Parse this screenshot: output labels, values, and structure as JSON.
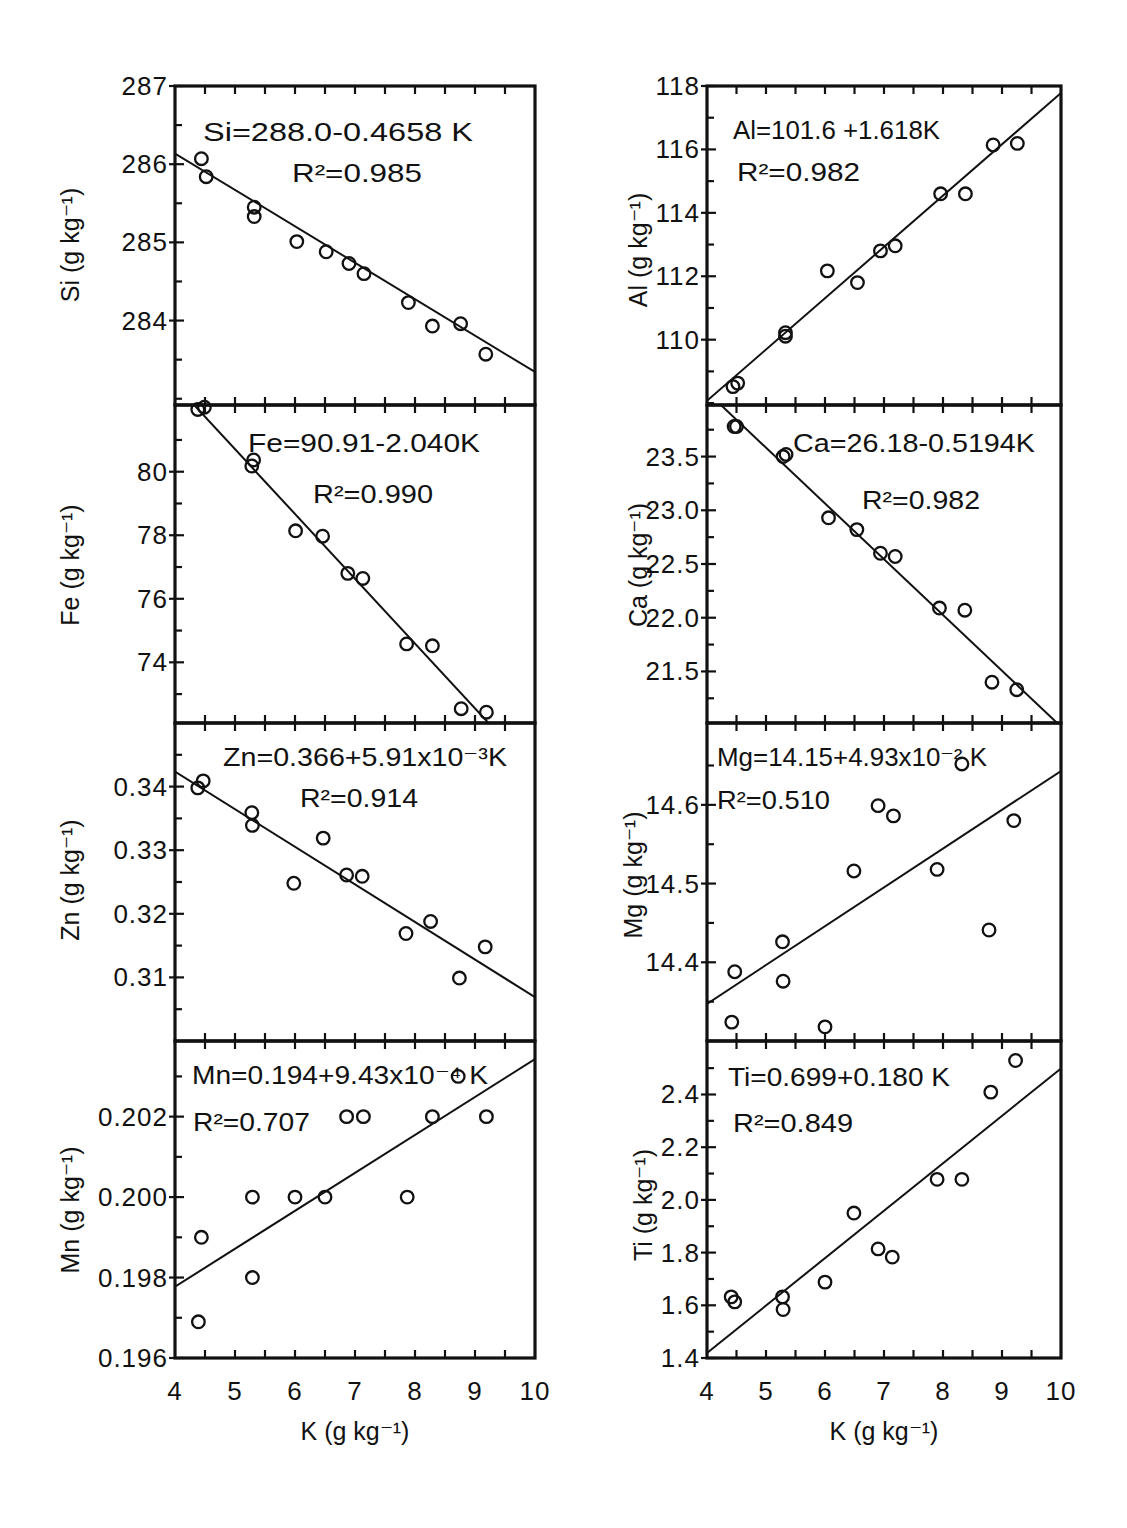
{
  "figure": {
    "panel_order": [
      "Si",
      "Al",
      "Fe",
      "Ca",
      "Zn",
      "Mg",
      "Mn",
      "Ti"
    ]
  },
  "chart_data": [
    {
      "id": "si",
      "type": "scatter",
      "title": "",
      "ylabel": "Si (g kg⁻¹)",
      "xlim": [
        4,
        10
      ],
      "ylim": [
        282.92,
        287.0
      ],
      "yticks": [
        287,
        286,
        285,
        284
      ],
      "yticklabels": [
        "287",
        "286",
        "285",
        "284"
      ],
      "yminor": [
        286.5,
        285.5,
        284.5,
        283.5,
        283.0
      ],
      "equation": "Si=288.0-0.4658 K",
      "r2": "R²=0.985",
      "fit": {
        "intercept": 288.0,
        "slope": -0.4658
      },
      "points": [
        [
          4.44,
          286.07
        ],
        [
          4.52,
          285.84
        ],
        [
          5.32,
          285.45
        ],
        [
          5.32,
          285.33
        ],
        [
          6.03,
          285.01
        ],
        [
          6.52,
          284.88
        ],
        [
          6.9,
          284.73
        ],
        [
          7.15,
          284.6
        ],
        [
          7.89,
          284.23
        ],
        [
          8.29,
          283.93
        ],
        [
          8.76,
          283.96
        ],
        [
          9.18,
          283.57
        ]
      ],
      "grid": false
    },
    {
      "id": "al",
      "type": "scatter",
      "title": "",
      "ylabel": "Al (g kg⁻¹)",
      "xlim": [
        4,
        10
      ],
      "ylim": [
        107.94,
        118.0
      ],
      "yticks": [
        118,
        116,
        114,
        112,
        110
      ],
      "yticklabels": [
        "118",
        "116",
        "114",
        "112",
        "110"
      ],
      "yminor": [
        117,
        115,
        113,
        111,
        109,
        108
      ],
      "equation": "Al=101.6 +1.618K",
      "r2": "R²=0.982",
      "fit": {
        "intercept": 101.6,
        "slope": 1.618
      },
      "points": [
        [
          4.44,
          108.52
        ],
        [
          4.52,
          108.63
        ],
        [
          5.33,
          110.22
        ],
        [
          5.33,
          110.11
        ],
        [
          6.04,
          112.17
        ],
        [
          6.55,
          111.8
        ],
        [
          6.94,
          112.8
        ],
        [
          7.19,
          112.96
        ],
        [
          7.96,
          114.6
        ],
        [
          8.38,
          114.6
        ],
        [
          8.85,
          116.14
        ],
        [
          9.26,
          116.19
        ]
      ],
      "grid": false
    },
    {
      "id": "fe",
      "type": "scatter",
      "title": "",
      "ylabel": "Fe (g kg⁻¹)",
      "xlim": [
        4,
        10
      ],
      "ylim": [
        72.09,
        82.1
      ],
      "yticks": [
        80,
        78,
        76,
        74
      ],
      "yticklabels": [
        "80",
        "78",
        "76",
        "74"
      ],
      "yminor": [
        81,
        79,
        77,
        75,
        73
      ],
      "equation": "Fe=90.91-2.040K",
      "r2": "R²=0.990",
      "fit": {
        "intercept": 90.91,
        "slope": -2.04
      },
      "points": [
        [
          4.38,
          81.96
        ],
        [
          4.49,
          82.03
        ],
        [
          5.31,
          80.37
        ],
        [
          5.28,
          80.18
        ],
        [
          6.01,
          78.14
        ],
        [
          6.46,
          77.97
        ],
        [
          6.88,
          76.8
        ],
        [
          7.13,
          76.64
        ],
        [
          7.86,
          74.58
        ],
        [
          8.29,
          74.52
        ],
        [
          8.77,
          72.54
        ],
        [
          9.19,
          72.43
        ]
      ],
      "grid": false
    },
    {
      "id": "ca",
      "type": "scatter",
      "title": "",
      "ylabel": "Ca (g kg⁻¹)",
      "xlim": [
        4,
        10
      ],
      "ylim": [
        21.02,
        23.98
      ],
      "yticks": [
        23.5,
        23.0,
        22.5,
        22.0,
        21.5
      ],
      "yticklabels": [
        "23.5",
        "23.0",
        "22.5",
        "22.0",
        "21.5"
      ],
      "yminor": [
        23.75,
        23.25,
        22.75,
        22.25,
        21.75,
        21.25
      ],
      "equation": "Ca=26.18-0.5194K",
      "r2": "R²=0.982",
      "fit": {
        "intercept": 26.18,
        "slope": -0.5194
      },
      "points": [
        [
          4.46,
          23.78
        ],
        [
          4.5,
          23.78
        ],
        [
          5.29,
          23.5
        ],
        [
          5.34,
          23.52
        ],
        [
          6.06,
          22.93
        ],
        [
          6.54,
          22.82
        ],
        [
          6.94,
          22.6
        ],
        [
          7.19,
          22.57
        ],
        [
          7.94,
          22.09
        ],
        [
          8.37,
          22.07
        ],
        [
          8.83,
          21.4
        ],
        [
          9.25,
          21.33
        ]
      ],
      "grid": false
    },
    {
      "id": "zn",
      "type": "scatter",
      "title": "",
      "ylabel": "Zn (g kg⁻¹)",
      "xlim": [
        4,
        10
      ],
      "ylim": [
        0.3,
        0.35
      ],
      "yticks": [
        0.34,
        0.33,
        0.32,
        0.31
      ],
      "yticklabels": [
        "0.34",
        "0.33",
        "0.32",
        "0.31"
      ],
      "yminor": [
        0.345,
        0.335,
        0.325,
        0.315,
        0.305
      ],
      "equation": "Zn=0.366+5.91x10⁻³K",
      "r2": "R²=0.914",
      "fit": {
        "intercept": 0.366,
        "slope": -0.00591
      },
      "points": [
        [
          4.38,
          0.3398
        ],
        [
          4.47,
          0.3409
        ],
        [
          5.28,
          0.3359
        ],
        [
          5.29,
          0.3339
        ],
        [
          5.98,
          0.3248
        ],
        [
          6.47,
          0.3319
        ],
        [
          6.86,
          0.3261
        ],
        [
          7.12,
          0.3259
        ],
        [
          7.85,
          0.3169
        ],
        [
          8.26,
          0.3188
        ],
        [
          8.74,
          0.3099
        ],
        [
          9.17,
          0.3148
        ]
      ],
      "grid": false
    },
    {
      "id": "mg",
      "type": "scatter",
      "title": "",
      "ylabel": "Mg (g kg⁻¹)",
      "xlim": [
        4,
        10
      ],
      "ylim": [
        14.3,
        14.704
      ],
      "yticks": [
        14.6,
        14.5,
        14.4
      ],
      "yticklabels": [
        "14.6",
        "14.5",
        "14.4"
      ],
      "yminor": [
        14.65,
        14.55,
        14.45,
        14.35
      ],
      "equation": "Mg=14.15+4.93x10⁻² K",
      "r2": "R²=0.510",
      "fit": {
        "intercept": 14.15,
        "slope": 0.0493
      },
      "points": [
        [
          4.42,
          14.324
        ],
        [
          4.47,
          14.388
        ],
        [
          5.28,
          14.426
        ],
        [
          5.29,
          14.376
        ],
        [
          6.0,
          14.318
        ],
        [
          6.49,
          14.516
        ],
        [
          6.9,
          14.599
        ],
        [
          7.16,
          14.586
        ],
        [
          7.9,
          14.518
        ],
        [
          8.32,
          14.652
        ],
        [
          8.78,
          14.441
        ],
        [
          9.2,
          14.58
        ]
      ],
      "grid": false
    },
    {
      "id": "mn",
      "type": "scatter",
      "title": "",
      "ylabel": "Mn (g kg⁻¹)",
      "xlabel": "K (g kg⁻¹)",
      "xlim": [
        4,
        10
      ],
      "ylim": [
        0.196,
        0.20388
      ],
      "xticks": [
        4,
        5,
        6,
        7,
        8,
        9,
        10
      ],
      "xticklabels": [
        "4",
        "5",
        "6",
        "7",
        "8",
        "9",
        "10"
      ],
      "yticks": [
        0.202,
        0.2,
        0.198,
        0.196
      ],
      "yticklabels": [
        "0.202",
        "0.200",
        "0.198",
        "0.196"
      ],
      "yminor": [
        0.203,
        0.201,
        0.199,
        0.197
      ],
      "equation": "Mn=0.194+9.43x10⁻⁴ K",
      "r2": "R²=0.707",
      "fit": {
        "intercept": 0.194,
        "slope": 0.000943
      },
      "points": [
        [
          4.39,
          0.1969
        ],
        [
          4.44,
          0.199
        ],
        [
          5.29,
          0.2
        ],
        [
          5.29,
          0.198
        ],
        [
          6.0,
          0.2
        ],
        [
          6.5,
          0.2
        ],
        [
          6.86,
          0.202
        ],
        [
          7.14,
          0.202
        ],
        [
          7.87,
          0.2
        ],
        [
          8.29,
          0.202
        ],
        [
          8.72,
          0.203
        ],
        [
          9.19,
          0.202
        ]
      ],
      "grid": false
    },
    {
      "id": "ti",
      "type": "scatter",
      "title": "",
      "ylabel": "Ti (g kg⁻¹)",
      "xlabel": "K (g kg⁻¹)",
      "xlim": [
        4,
        10
      ],
      "ylim": [
        1.4,
        2.603
      ],
      "xticks": [
        4,
        5,
        6,
        7,
        8,
        9,
        10
      ],
      "xticklabels": [
        "4",
        "5",
        "6",
        "7",
        "8",
        "9",
        "10"
      ],
      "yticks": [
        2.4,
        2.2,
        2.0,
        1.8,
        1.6,
        1.4
      ],
      "yticklabels": [
        "2.4",
        "2.2",
        "2.0",
        "1.8",
        "1.6",
        "1.4"
      ],
      "yminor": [
        2.5,
        2.3,
        2.1,
        1.9,
        1.7,
        1.5
      ],
      "equation": "Ti=0.699+0.180 K",
      "r2": "R²=0.849",
      "fit": {
        "intercept": 0.699,
        "slope": 0.18
      },
      "points": [
        [
          4.41,
          1.632
        ],
        [
          4.47,
          1.613
        ],
        [
          5.28,
          1.632
        ],
        [
          5.29,
          1.584
        ],
        [
          6.0,
          1.688
        ],
        [
          6.49,
          1.95
        ],
        [
          6.9,
          1.814
        ],
        [
          7.14,
          1.783
        ],
        [
          7.9,
          2.078
        ],
        [
          8.32,
          2.078
        ],
        [
          8.81,
          2.409
        ],
        [
          9.23,
          2.529
        ]
      ],
      "grid": false
    }
  ]
}
